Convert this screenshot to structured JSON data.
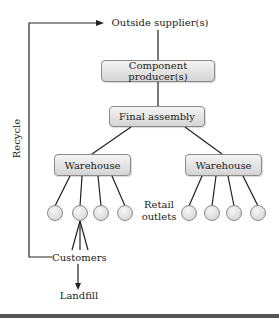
{
  "diagram": {
    "nodes": {
      "outside_supplier": "Outside supplier(s)",
      "component_producer": "Component producer(s)",
      "final_assembly": "Final assembly",
      "warehouse_left": "Warehouse",
      "warehouse_right": "Warehouse",
      "retail_outlets_line1": "Retail",
      "retail_outlets_line2": "outlets",
      "customers": "Customers",
      "landfill": "Landfill"
    },
    "recycle_label": "Recycle",
    "retail_outlet_count_per_warehouse": 4,
    "colors": {
      "line": "#222222",
      "box_border": "#8a8a8a",
      "box_fill_top": "#f4f4f4",
      "box_fill_bottom": "#d4d4d4"
    }
  }
}
